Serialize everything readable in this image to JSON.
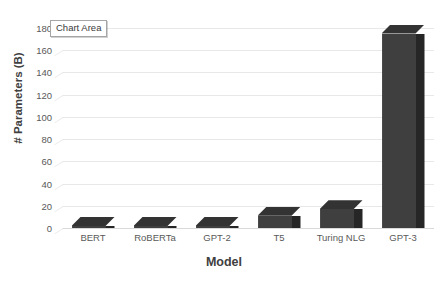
{
  "tooltip": {
    "label": "Chart Area"
  },
  "chart_data": {
    "type": "bar",
    "title": "",
    "xlabel": "Model",
    "ylabel": "# Parameters (B)",
    "categories": [
      "BERT",
      "RoBERTa",
      "GPT-2",
      "T5",
      "Turing NLG",
      "GPT-3"
    ],
    "values": [
      0.34,
      0.35,
      1.5,
      11,
      17,
      175
    ],
    "ylim": [
      0,
      180
    ],
    "ytick_labels": [
      "0",
      "20",
      "40",
      "60",
      "80",
      "100",
      "120",
      "140",
      "160",
      "180"
    ],
    "ytick_values": [
      0,
      20,
      40,
      60,
      80,
      100,
      120,
      140,
      160,
      180
    ],
    "ystep": 20,
    "grid": true,
    "legend": false,
    "style": "3d-column",
    "colors": {
      "bar_front": "#3f3f3f",
      "bar_side": "#262626",
      "bar_top": "#333333",
      "gridline": "#e8e8e8",
      "axis_text": "#595959",
      "title_text": "#404040",
      "background": "#ffffff"
    }
  }
}
